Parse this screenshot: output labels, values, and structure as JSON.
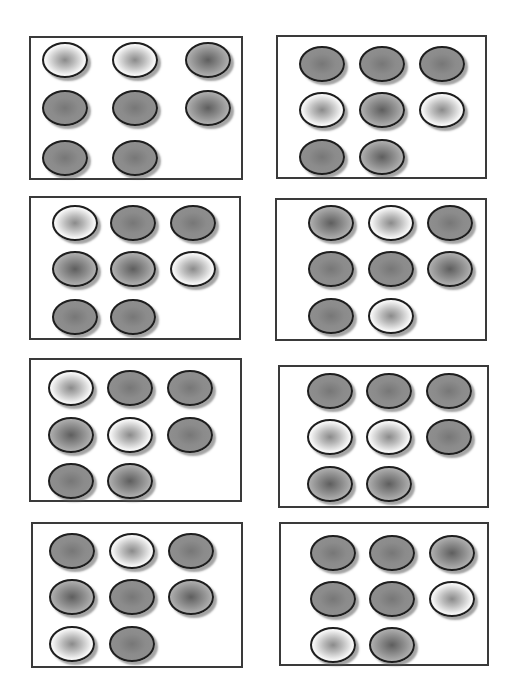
{
  "worksheet": {
    "panels": [
      {
        "box": [
          29,
          36,
          214,
          144
        ],
        "cols": [
          11,
          81,
          154
        ],
        "rows": [
          4,
          52,
          102
        ],
        "dots": [
          [
            "light",
            "light",
            "medium"
          ],
          [
            "dark",
            "dark",
            "medium"
          ],
          [
            "dark",
            "dark"
          ]
        ]
      },
      {
        "box": [
          276,
          35,
          211,
          144
        ],
        "cols": [
          21,
          81,
          141
        ],
        "rows": [
          9,
          55,
          102
        ],
        "dots": [
          [
            "dark",
            "dark",
            "dark"
          ],
          [
            "light",
            "medium",
            "light"
          ],
          [
            "dark",
            "medium"
          ]
        ]
      },
      {
        "box": [
          29,
          196,
          212,
          144
        ],
        "cols": [
          21,
          79,
          139
        ],
        "rows": [
          7,
          53,
          101
        ],
        "dots": [
          [
            "light",
            "dark",
            "dark"
          ],
          [
            "medium",
            "medium",
            "light"
          ],
          [
            "dark",
            "dark"
          ]
        ]
      },
      {
        "box": [
          275,
          198,
          212,
          143
        ],
        "cols": [
          31,
          91,
          150
        ],
        "rows": [
          5,
          51,
          98
        ],
        "dots": [
          [
            "medium",
            "light",
            "dark"
          ],
          [
            "dark",
            "dark",
            "medium"
          ],
          [
            "dark",
            "light"
          ]
        ]
      },
      {
        "box": [
          29,
          358,
          213,
          144
        ],
        "cols": [
          17,
          76,
          136
        ],
        "rows": [
          10,
          57,
          103
        ],
        "dots": [
          [
            "light",
            "dark",
            "dark"
          ],
          [
            "medium",
            "light",
            "dark"
          ],
          [
            "dark",
            "medium"
          ]
        ]
      },
      {
        "box": [
          278,
          365,
          211,
          143
        ],
        "cols": [
          27,
          86,
          146
        ],
        "rows": [
          6,
          52,
          99
        ],
        "dots": [
          [
            "dark",
            "dark",
            "dark"
          ],
          [
            "light",
            "light",
            "dark"
          ],
          [
            "medium",
            "medium"
          ]
        ]
      },
      {
        "box": [
          31,
          522,
          212,
          146
        ],
        "cols": [
          16,
          76,
          135
        ],
        "rows": [
          9,
          55,
          102
        ],
        "dots": [
          [
            "dark",
            "light",
            "dark"
          ],
          [
            "medium",
            "dark",
            "medium"
          ],
          [
            "light",
            "dark"
          ]
        ]
      },
      {
        "box": [
          279,
          522,
          210,
          144
        ],
        "cols": [
          29,
          88,
          148
        ],
        "rows": [
          11,
          57,
          103
        ],
        "dots": [
          [
            "dark",
            "dark",
            "medium"
          ],
          [
            "dark",
            "dark",
            "light"
          ],
          [
            "light",
            "medium"
          ]
        ]
      }
    ],
    "dot_styles": {
      "light": "white-rim-gray-center",
      "medium": "light-gray-rim-dark-center",
      "dark": "flat-dark-gray"
    },
    "colors": {
      "border": "#3a3a3a",
      "dot_outline": "#1e1e1e",
      "background": "#ffffff"
    }
  }
}
